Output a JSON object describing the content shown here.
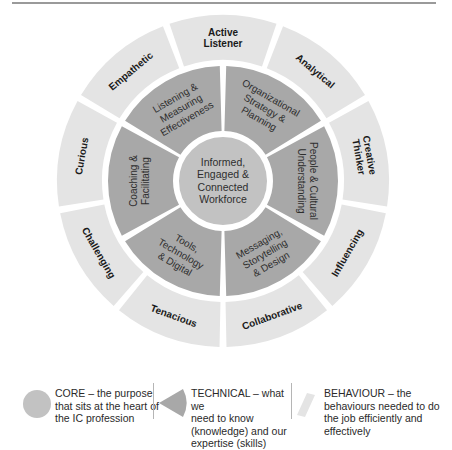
{
  "colors": {
    "behaviour": "#e4e4e4",
    "technical": "#a8a8a8",
    "core": "#c2c2c2",
    "gap": "#ffffff",
    "label_dark": "#1a1a1a",
    "label_technical": "#2e2e2e",
    "rule": "#9a9a9a"
  },
  "wheel": {
    "center": {
      "lines": [
        "Informed,",
        "Engaged &",
        "Connected",
        "Workforce"
      ]
    },
    "technical": [
      {
        "lines": [
          "Organizational",
          "Strategy &",
          "Planning"
        ]
      },
      {
        "lines": [
          "People & Cultural",
          "Understanding"
        ]
      },
      {
        "lines": [
          "Messaging,",
          "Storytelling",
          "& Design"
        ]
      },
      {
        "lines": [
          "Tools,",
          "Technology",
          "& Digital"
        ]
      },
      {
        "lines": [
          "Coaching &",
          "Facilitating"
        ]
      },
      {
        "lines": [
          "Listening &",
          "Measuring",
          "Effectiveness"
        ]
      }
    ],
    "behaviours": [
      "Active Listener",
      "Analytical",
      "Creative Thinker",
      "Influencing",
      "Collaborative",
      "Tenacious",
      "Challenging",
      "Curious",
      "Empathetic"
    ]
  },
  "legend": {
    "core": {
      "lines": [
        "CORE – the purpose",
        "that sits at the heart of",
        "the IC profession"
      ]
    },
    "technical": {
      "lines": [
        "TECHNICAL – what we",
        "need to know",
        "(knowledge) and our",
        "expertise (skills)"
      ]
    },
    "behaviour": {
      "lines": [
        "BEHAVIOUR –  the",
        "behaviours needed to do",
        "the job efficiently and",
        "effectively"
      ]
    }
  }
}
